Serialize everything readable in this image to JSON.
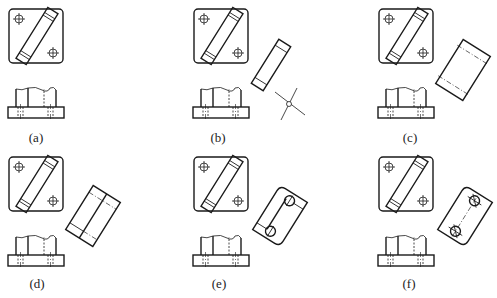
{
  "figure": {
    "panels": [
      {
        "id": "a",
        "label": "(a)",
        "step": "given top and front views"
      },
      {
        "id": "b",
        "label": "(b)",
        "step": "locate auxiliary projection direction and reference"
      },
      {
        "id": "c",
        "label": "(c)",
        "step": "draw auxiliary outline"
      },
      {
        "id": "d",
        "label": "(d)",
        "step": "add center division"
      },
      {
        "id": "e",
        "label": "(e)",
        "step": "add rounded end and holes"
      },
      {
        "id": "f",
        "label": "(f)",
        "step": "finish auxiliary view with centerlines"
      }
    ]
  },
  "colors": {
    "line": "#1a1a1a",
    "background": "#ffffff",
    "label": "#222222"
  }
}
